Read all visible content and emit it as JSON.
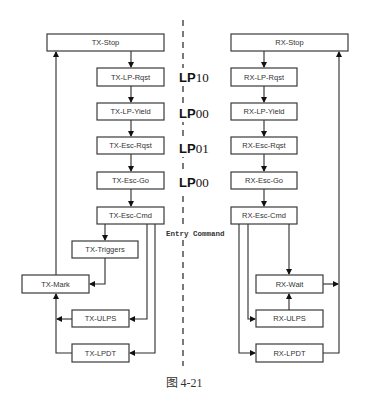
{
  "diagram": {
    "tx": {
      "stop": "TX-Stop",
      "lp_rqst": "TX-LP-Rqst",
      "lp_yield": "TX-LP-Yield",
      "esc_rqst": "TX-Esc-Rqst",
      "esc_go": "TX-Esc-Go",
      "esc_cmd": "TX-Esc-Cmd",
      "triggers": "TX-Triggers",
      "mark": "TX-Mark",
      "ulps": "TX-ULPS",
      "lpdt": "TX-LPDT"
    },
    "rx": {
      "stop": "RX-Stop",
      "lp_rqst": "RX-LP-Rqst",
      "lp_yield": "RX-LP-Yield",
      "esc_rqst": "RX-Esc-Rqst",
      "esc_go": "RX-Esc-Go",
      "esc_cmd": "RX-Esc-Cmd",
      "wait": "RX-Wait",
      "ulps": "RX-ULPS",
      "lpdt": "RX-LPDT"
    },
    "line_states": [
      {
        "prefix": "LP",
        "value": "10"
      },
      {
        "prefix": "LP",
        "value": "00"
      },
      {
        "prefix": "LP",
        "value": "01"
      },
      {
        "prefix": "LP",
        "value": "00"
      }
    ],
    "entry_command": "Entry Command",
    "caption": "图 4-21"
  }
}
